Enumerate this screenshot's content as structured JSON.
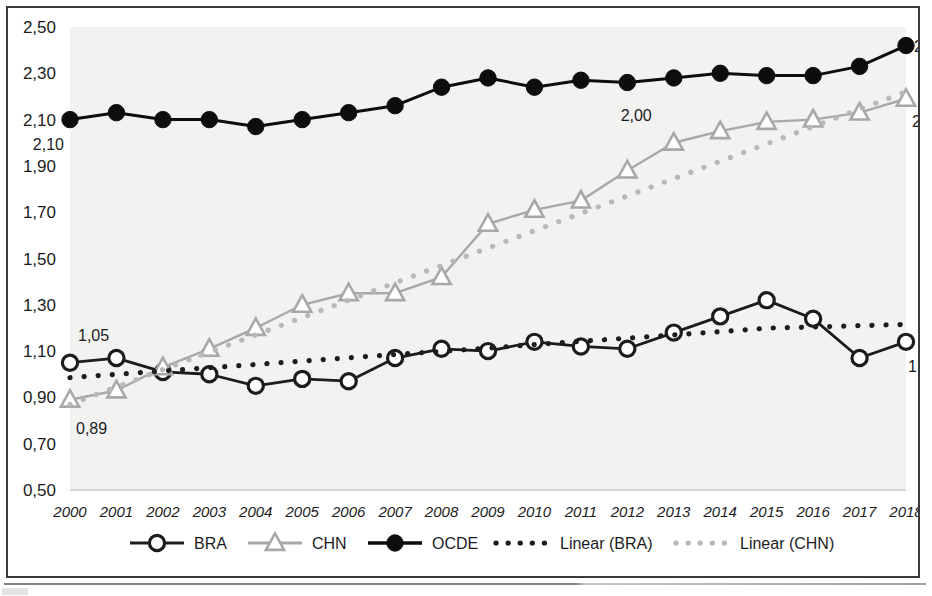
{
  "chart_data": {
    "type": "line",
    "title": "",
    "xlabel": "",
    "ylabel": "",
    "decimal_separator": ",",
    "x": [
      2000,
      2001,
      2002,
      2003,
      2004,
      2005,
      2006,
      2007,
      2008,
      2009,
      2010,
      2011,
      2012,
      2013,
      2014,
      2015,
      2016,
      2017,
      2018
    ],
    "categories": [
      "2000",
      "2001",
      "2002",
      "2003",
      "2004",
      "2005",
      "2006",
      "2007",
      "2008",
      "2009",
      "2010",
      "2011",
      "2012",
      "2013",
      "2014",
      "2015",
      "2016",
      "2017",
      "2018"
    ],
    "ylim": [
      0.5,
      2.5
    ],
    "yticks": [
      0.5,
      0.7,
      0.9,
      1.1,
      1.3,
      1.5,
      1.7,
      1.9,
      2.1,
      2.3,
      2.5
    ],
    "ytick_labels": [
      "0,50",
      "0,70",
      "0,90",
      "1,10",
      "1,30",
      "1,50",
      "1,70",
      "1,90",
      "2,10",
      "2,30",
      "2,50"
    ],
    "grid": false,
    "legend_position": "bottom",
    "series": [
      {
        "name": "BRA",
        "marker": "open-circle",
        "color": "#1c1c1e",
        "style": "solid",
        "values": [
          1.05,
          1.07,
          1.01,
          1.0,
          0.95,
          0.98,
          0.97,
          1.07,
          1.11,
          1.1,
          1.14,
          1.12,
          1.11,
          1.18,
          1.25,
          1.32,
          1.24,
          1.07,
          1.14
        ]
      },
      {
        "name": "CHN",
        "marker": "open-triangle",
        "color": "#a8a8a8",
        "style": "solid",
        "values": [
          0.89,
          0.93,
          1.03,
          1.11,
          1.2,
          1.3,
          1.35,
          1.35,
          1.42,
          1.65,
          1.71,
          1.75,
          1.88,
          2.0,
          2.05,
          2.09,
          2.1,
          2.13,
          2.19
        ]
      },
      {
        "name": "OCDE",
        "marker": "filled-circle",
        "color": "#0d0d0f",
        "style": "solid",
        "values": [
          2.1,
          2.13,
          2.1,
          2.1,
          2.07,
          2.1,
          2.13,
          2.16,
          2.24,
          2.28,
          2.24,
          2.27,
          2.26,
          2.28,
          2.3,
          2.29,
          2.29,
          2.33,
          2.42
        ]
      },
      {
        "name": "Linear (BRA)",
        "marker": "none",
        "color": "#1c1c1e",
        "style": "dotted",
        "values": [
          0.985,
          1.0,
          1.014,
          1.028,
          1.042,
          1.057,
          1.071,
          1.085,
          1.099,
          1.113,
          1.128,
          1.142,
          1.156,
          1.17,
          1.184,
          1.199,
          1.204,
          1.21,
          1.215
        ]
      },
      {
        "name": "Linear (CHN)",
        "marker": "none",
        "color": "#b8b8b8",
        "style": "dotted",
        "values": [
          0.87,
          0.945,
          1.02,
          1.095,
          1.17,
          1.245,
          1.32,
          1.395,
          1.47,
          1.545,
          1.62,
          1.695,
          1.77,
          1.845,
          1.92,
          1.995,
          2.07,
          2.145,
          2.22
        ]
      }
    ],
    "point_labels": [
      {
        "series": "BRA",
        "x": 2000,
        "value": 1.05,
        "text": "1,05",
        "dx": 8,
        "dy": -22
      },
      {
        "series": "CHN",
        "x": 2000,
        "value": 0.89,
        "text": "0,89",
        "dx": 6,
        "dy": 34
      },
      {
        "series": "OCDE",
        "x": 2000,
        "value": 2.1,
        "text": "2,10",
        "dx": -6,
        "dy": 30
      },
      {
        "series": "CHN",
        "x": 2013,
        "value": 2.0,
        "text": "2,00",
        "dx": -22,
        "dy": -22
      },
      {
        "series": "CHN",
        "x": 2018,
        "value": 2.19,
        "text": "2,19",
        "dx": 6,
        "dy": 28
      },
      {
        "series": "OCDE",
        "x": 2018,
        "value": 2.42,
        "text": "2,42",
        "dx": 8,
        "dy": 6
      },
      {
        "series": "BRA",
        "x": 2018,
        "value": 1.14,
        "text": "1,14",
        "dx": 2,
        "dy": 30
      }
    ],
    "legend": [
      {
        "label": "BRA",
        "marker": "open-circle",
        "color": "#1c1c1e",
        "style": "solid"
      },
      {
        "label": "CHN",
        "marker": "open-triangle",
        "color": "#a8a8a8",
        "style": "solid"
      },
      {
        "label": "OCDE",
        "marker": "filled-circle",
        "color": "#0d0d0f",
        "style": "solid"
      },
      {
        "label": "Linear (BRA)",
        "marker": "none",
        "color": "#1c1c1e",
        "style": "dotted"
      },
      {
        "label": "Linear (CHN)",
        "marker": "none",
        "color": "#b8b8b8",
        "style": "dotted"
      }
    ]
  }
}
